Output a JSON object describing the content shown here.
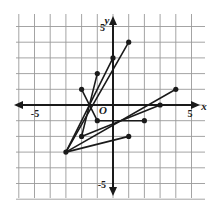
{
  "figure": {
    "kind": "coordinate-plane-line-segments",
    "background_color": "#ffffff",
    "grid_color": "#9a9a9a",
    "axis_color": "#1a1a1a",
    "data_color": "#1a1a1a"
  },
  "axes": {
    "x_axis_label": "x",
    "y_axis_label": "y",
    "origin_label": "O",
    "x_tick_labels": [
      {
        "text": "-5",
        "value": -5
      },
      {
        "text": "5",
        "value": 5
      }
    ],
    "y_tick_labels": [
      {
        "text": "5",
        "value": 5
      },
      {
        "text": "-5",
        "value": -5
      }
    ]
  },
  "chart_data": {
    "type": "line",
    "title": "",
    "xlabel": "x",
    "ylabel": "y",
    "xlim": [
      -6,
      6
    ],
    "ylim": [
      -6,
      6
    ],
    "grid": true,
    "legend": "none",
    "origin_label": "O",
    "x_ticks": [
      -5,
      5
    ],
    "y_ticks": [
      -5,
      5
    ],
    "grid_step": 1,
    "series": [
      {
        "name": "segment-1",
        "x": [
          -3,
          1
        ],
        "y": [
          -3,
          4
        ],
        "endpoints_marked": true
      },
      {
        "name": "segment-2",
        "x": [
          -3,
          0
        ],
        "y": [
          -3,
          3
        ],
        "endpoints_marked": true
      },
      {
        "name": "segment-3",
        "x": [
          -2,
          -1
        ],
        "y": [
          -2,
          2
        ],
        "endpoints_marked": true
      },
      {
        "name": "segment-4",
        "x": [
          -1,
          -2
        ],
        "y": [
          -1,
          1
        ],
        "endpoints_marked": true
      },
      {
        "name": "segment-5",
        "x": [
          -3,
          4
        ],
        "y": [
          -3,
          1
        ],
        "endpoints_marked": true
      },
      {
        "name": "segment-6",
        "x": [
          -2,
          3
        ],
        "y": [
          -2,
          0
        ],
        "endpoints_marked": true
      },
      {
        "name": "segment-7",
        "x": [
          -1,
          2
        ],
        "y": [
          -1,
          -1
        ],
        "endpoints_marked": true
      },
      {
        "name": "segment-8",
        "x": [
          -3,
          1
        ],
        "y": [
          -3,
          -2
        ],
        "endpoints_marked": true
      }
    ],
    "points": [
      {
        "x": -3,
        "y": -3
      },
      {
        "x": -2,
        "y": -2
      },
      {
        "x": -1,
        "y": -1
      },
      {
        "x": -2,
        "y": 1
      },
      {
        "x": -1,
        "y": 2
      },
      {
        "x": 0,
        "y": 3
      },
      {
        "x": 1,
        "y": 4
      },
      {
        "x": 1,
        "y": -2
      },
      {
        "x": 2,
        "y": -1
      },
      {
        "x": 3,
        "y": 0
      },
      {
        "x": 4,
        "y": 1
      }
    ]
  }
}
